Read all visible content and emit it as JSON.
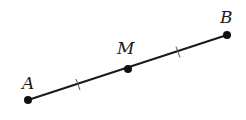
{
  "diagram": {
    "type": "line-segment-midpoint",
    "segment": {
      "from": "A",
      "to": "B",
      "color": "#1a1a1a"
    },
    "points": [
      {
        "name": "A",
        "label": "A",
        "x": 28,
        "y": 100,
        "label_x": 22,
        "label_y": 89
      },
      {
        "name": "M",
        "label": "M",
        "x": 128,
        "y": 69,
        "label_x": 118,
        "label_y": 54
      },
      {
        "name": "B",
        "label": "B",
        "x": 227,
        "y": 35,
        "label_x": 220,
        "label_y": 23
      }
    ],
    "tick_marks": [
      {
        "segment": "AM",
        "x": 78,
        "y": 84.5
      },
      {
        "segment": "MB",
        "x": 178,
        "y": 52
      }
    ]
  }
}
